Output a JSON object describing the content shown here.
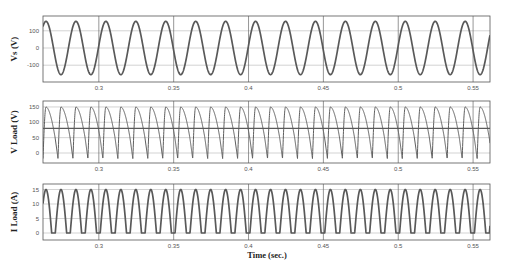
{
  "chart_data": [
    {
      "type": "line",
      "title": "",
      "ylabel": "Vs (V)",
      "xlabel": "",
      "xlim": [
        0.2627,
        0.5613
      ],
      "ylim": [
        -185,
        185
      ],
      "yticks": [
        100,
        0,
        -100
      ],
      "xticks": [
        0.3,
        0.35,
        0.4,
        0.45,
        0.5,
        0.55
      ],
      "xtick_labels": [
        "0.3",
        "0.35",
        "0.4",
        "0.45",
        "0.5",
        "0.55"
      ],
      "grid": true,
      "series": [
        {
          "name": "Vs",
          "waveform": "sine",
          "amplitude": 155,
          "frequency_hz": 50,
          "phase_ref_peak_t": 0.2647
        }
      ]
    },
    {
      "type": "line",
      "title": "",
      "ylabel": "V Load (V)",
      "xlabel": "",
      "xlim": [
        0.2627,
        0.5613
      ],
      "ylim": [
        -30,
        165
      ],
      "yticks": [
        150,
        100,
        50,
        0
      ],
      "xticks": [
        0.3,
        0.35,
        0.4,
        0.45,
        0.5,
        0.55
      ],
      "xtick_labels": [
        "0.3",
        "0.35",
        "0.4",
        "0.45",
        "0.5",
        "0.55"
      ],
      "grid": true,
      "series": [
        {
          "name": "V Load",
          "waveform": "rectified-with-negative-notch",
          "peak": 150,
          "min": -20,
          "ripple_frequency_hz": 100
        },
        {
          "name": "V Load average",
          "waveform": "constant",
          "value": 80
        }
      ]
    },
    {
      "type": "line",
      "title": "",
      "ylabel": "I Load (A)",
      "xlabel": "Time (sec.)",
      "xlim": [
        0.2627,
        0.5613
      ],
      "ylim": [
        -2,
        17
      ],
      "yticks": [
        15,
        10,
        5,
        0
      ],
      "xticks": [
        0.3,
        0.35,
        0.4,
        0.45,
        0.5,
        0.55
      ],
      "xtick_labels": [
        "0.3",
        "0.35",
        "0.4",
        "0.45",
        "0.5",
        "0.55"
      ],
      "grid": true,
      "series": [
        {
          "name": "I Load",
          "waveform": "rectified-discontinuous",
          "peak": 15,
          "min": 0,
          "ripple_frequency_hz": 100
        }
      ]
    }
  ],
  "axes_labels": {
    "vs": "Vs (V)",
    "vload": "V Load (V)",
    "iload": "I Load (A)",
    "time": "Time (sec.)"
  }
}
